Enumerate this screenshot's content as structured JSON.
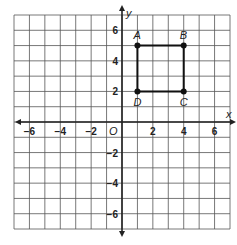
{
  "chart_data": {
    "type": "scatter",
    "title": "",
    "xlabel": "x",
    "ylabel": "y",
    "origin_label": "O",
    "xlim": [
      -7,
      7
    ],
    "ylim": [
      -7,
      7
    ],
    "grid": true,
    "x_ticks": [
      -6,
      -4,
      -2,
      2,
      4,
      6
    ],
    "y_ticks": [
      6,
      4,
      2,
      -2,
      -4,
      -6
    ],
    "x_tick_labels": [
      "−6",
      "−4",
      "−2",
      "2",
      "4",
      "6"
    ],
    "y_tick_labels": [
      "6",
      "4",
      "2",
      "−2",
      "−4",
      "−6"
    ],
    "points": [
      {
        "label": "A",
        "x": 1,
        "y": 5
      },
      {
        "label": "B",
        "x": 4,
        "y": 5
      },
      {
        "label": "C",
        "x": 4,
        "y": 2
      },
      {
        "label": "D",
        "x": 1,
        "y": 2
      }
    ],
    "polygon": [
      "A",
      "B",
      "C",
      "D"
    ],
    "colors": {
      "grid": "#555555",
      "axes": "#222222",
      "shape": "#111111"
    }
  }
}
